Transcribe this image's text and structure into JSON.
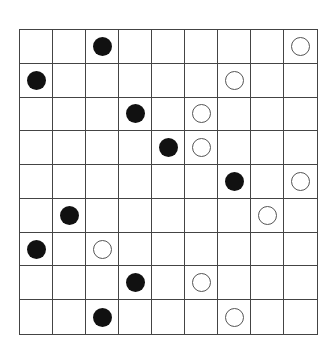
{
  "board": {
    "rows": 9,
    "cols": 9,
    "colors": {
      "black": "#111111",
      "white": "#ffffff",
      "line": "#444444"
    },
    "stones": [
      {
        "row": 0,
        "col": 2,
        "color": "black"
      },
      {
        "row": 0,
        "col": 8,
        "color": "white"
      },
      {
        "row": 1,
        "col": 0,
        "color": "black"
      },
      {
        "row": 1,
        "col": 6,
        "color": "white"
      },
      {
        "row": 2,
        "col": 3,
        "color": "black"
      },
      {
        "row": 2,
        "col": 5,
        "color": "white"
      },
      {
        "row": 3,
        "col": 4,
        "color": "black"
      },
      {
        "row": 3,
        "col": 5,
        "color": "white"
      },
      {
        "row": 4,
        "col": 6,
        "color": "black"
      },
      {
        "row": 4,
        "col": 8,
        "color": "white"
      },
      {
        "row": 5,
        "col": 1,
        "color": "black"
      },
      {
        "row": 5,
        "col": 7,
        "color": "white"
      },
      {
        "row": 6,
        "col": 0,
        "color": "black"
      },
      {
        "row": 6,
        "col": 2,
        "color": "white"
      },
      {
        "row": 7,
        "col": 3,
        "color": "black"
      },
      {
        "row": 7,
        "col": 5,
        "color": "white"
      },
      {
        "row": 8,
        "col": 2,
        "color": "black"
      },
      {
        "row": 8,
        "col": 6,
        "color": "white"
      }
    ]
  }
}
